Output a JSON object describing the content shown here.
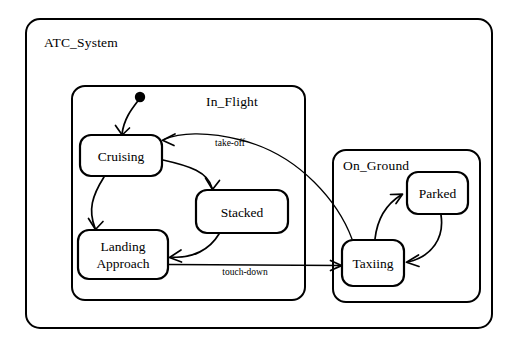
{
  "diagram": {
    "type": "uml-statechart",
    "title": "ATC_System",
    "background_color": "#ffffff",
    "line_color": "#000000"
  },
  "regions": [
    {
      "id": "atc_system",
      "label": "ATC_System",
      "kind": "outer-frame",
      "x": 26,
      "y": 19,
      "width": 466,
      "height": 309,
      "label_x": 44,
      "label_y": 47
    },
    {
      "id": "in_flight",
      "label": "In_Flight",
      "kind": "composite-state",
      "x": 72,
      "y": 86,
      "width": 233,
      "height": 214,
      "label_x": 232,
      "label_y": 106
    },
    {
      "id": "on_ground",
      "label": "On_Ground",
      "kind": "composite-state",
      "x": 333,
      "y": 150,
      "width": 147,
      "height": 152,
      "label_x": 343,
      "label_y": 170
    }
  ],
  "states": [
    {
      "id": "cruising",
      "label": "Cruising",
      "parent": "in_flight",
      "x": 80,
      "y": 135,
      "width": 82,
      "height": 41,
      "label_lines": [
        "Cruising"
      ]
    },
    {
      "id": "stacked",
      "label": "Stacked",
      "parent": "in_flight",
      "x": 196,
      "y": 190,
      "width": 92,
      "height": 43,
      "label_lines": [
        "Stacked"
      ]
    },
    {
      "id": "landing_approach",
      "label": "Landing Approach",
      "parent": "in_flight",
      "x": 78,
      "y": 230,
      "width": 90,
      "height": 49,
      "label_lines": [
        "Landing",
        "Approach"
      ]
    },
    {
      "id": "taxiing",
      "label": "Taxiing",
      "parent": "on_ground",
      "x": 342,
      "y": 240,
      "width": 62,
      "height": 46,
      "label_lines": [
        "Taxiing"
      ]
    },
    {
      "id": "parked",
      "label": "Parked",
      "parent": "on_ground",
      "x": 407,
      "y": 172,
      "width": 61,
      "height": 42,
      "label_lines": [
        "Parked"
      ]
    }
  ],
  "pseudostates": [
    {
      "id": "initial",
      "kind": "initial",
      "parent": "in_flight",
      "cx": 140,
      "cy": 97,
      "r": 5.2
    }
  ],
  "transitions": [
    {
      "id": "t_initial_cruising",
      "from": "initial",
      "to": "cruising",
      "label": "",
      "path": "M 137.5 101.5 C 131 110, 124 119, 122 134"
    },
    {
      "id": "t_cruising_stacked",
      "from": "cruising",
      "to": "stacked",
      "label": "",
      "path": "M 163 160 C 190 166, 208 172, 212 188"
    },
    {
      "id": "t_cruising_landing",
      "from": "cruising",
      "to": "landing_approach",
      "label": "",
      "path": "M 104 177 C 92 196, 88 210, 95 228"
    },
    {
      "id": "t_stacked_landing",
      "from": "stacked",
      "to": "landing_approach",
      "label": "",
      "path": "M 219 234 C 210 249, 193 259, 170 257"
    },
    {
      "id": "t_landing_taxiing",
      "from": "landing_approach",
      "to": "taxiing",
      "label": "touch-down",
      "label_x": 245,
      "label_y": 275,
      "path": "M 169 264 L 340 265"
    },
    {
      "id": "t_taxiing_cruising",
      "from": "taxiing",
      "to": "cruising",
      "label": "take-off",
      "label_x": 230,
      "label_y": 146,
      "path": "M 352 239 C 340 205, 300 155, 240 140 C 205 131, 178 133, 164 139"
    },
    {
      "id": "t_taxiing_parked",
      "from": "taxiing",
      "to": "parked",
      "label": "",
      "path": "M 375 239 C 377 222, 384 206, 400 195"
    },
    {
      "id": "t_parked_taxiing",
      "from": "parked",
      "to": "taxiing",
      "label": "",
      "path": "M 441 215 C 444 238, 432 256, 409 262"
    }
  ]
}
